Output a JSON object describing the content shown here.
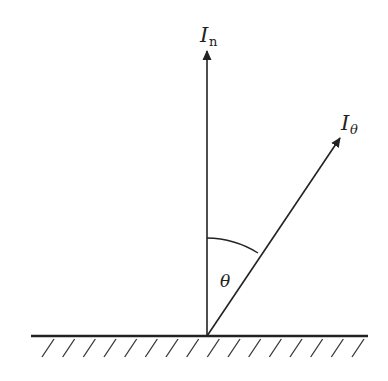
{
  "diagram": {
    "type": "vector-angle-diagram",
    "labels": {
      "normal_vector": "I",
      "normal_subscript": "n",
      "angled_vector": "I",
      "angled_subscript": "θ",
      "angle": "θ"
    },
    "colors": {
      "stroke": "#222222",
      "background": "#ffffff"
    },
    "geometry": {
      "origin": [
        207,
        336
      ],
      "normal_tip": [
        207,
        50
      ],
      "angled_tip": [
        341,
        137
      ],
      "surface_line": [
        [
          31,
          336
        ],
        [
          368,
          336
        ]
      ],
      "hatch_count": 16
    }
  }
}
